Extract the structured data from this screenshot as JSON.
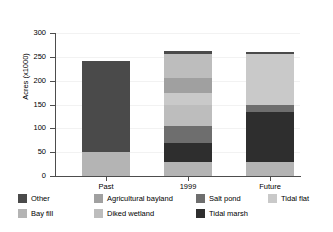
{
  "chart_data": {
    "type": "bar",
    "stacked": true,
    "title": "",
    "xlabel": "",
    "ylabel": "Acres (x1000)",
    "categories": [
      "Past",
      "1999",
      "Future"
    ],
    "ylim": [
      0,
      300
    ],
    "yticks": [
      0,
      50,
      100,
      150,
      200,
      250,
      300
    ],
    "ytick_labels": [
      "0",
      "50",
      "100",
      "150",
      "200",
      "250",
      "300"
    ],
    "grid": true,
    "legend_position": "bottom",
    "series": [
      {
        "name": "Bay fill",
        "color": "#b4b4b4",
        "values": [
          50,
          30,
          29
        ]
      },
      {
        "name": "Tidal marsh",
        "color": "#2e2e2e",
        "values": [
          0,
          39,
          106
        ]
      },
      {
        "name": "Salt pond",
        "color": "#6e6e6e",
        "values": [
          0,
          35,
          13
        ]
      },
      {
        "name": "Diked wetland",
        "color": "#bdbdbd",
        "values": [
          0,
          46,
          0
        ]
      },
      {
        "name": "Tidal flat",
        "color": "#c9c9c9",
        "values": [
          0,
          25,
          108
        ]
      },
      {
        "name": "Agricultural bayland",
        "color": "#a0a0a0",
        "values": [
          0,
          30,
          0
        ]
      },
      {
        "name": "Diked wetland 2",
        "color": "#bdbdbd",
        "values": [
          0,
          50,
          0
        ]
      },
      {
        "name": "Other",
        "color": "#4a4a4a",
        "values": [
          192,
          7,
          5
        ]
      }
    ],
    "totals": [
      242,
      262,
      261
    ],
    "bar_stacks": [
      {
        "category": "Past",
        "segments": [
          {
            "name": "Bay fill",
            "start": 0,
            "end": 50,
            "color": "#b4b4b4"
          },
          {
            "name": "Other",
            "start": 50,
            "end": 242,
            "color": "#4a4a4a"
          }
        ]
      },
      {
        "category": "1999",
        "segments": [
          {
            "name": "Bay fill",
            "start": 0,
            "end": 30,
            "color": "#b4b4b4"
          },
          {
            "name": "Tidal marsh",
            "start": 30,
            "end": 69,
            "color": "#2e2e2e"
          },
          {
            "name": "Salt pond",
            "start": 69,
            "end": 104,
            "color": "#6e6e6e"
          },
          {
            "name": "Diked wetland",
            "start": 104,
            "end": 150,
            "color": "#bdbdbd"
          },
          {
            "name": "Tidal flat",
            "start": 150,
            "end": 175,
            "color": "#c9c9c9"
          },
          {
            "name": "Agricultural bayland",
            "start": 175,
            "end": 205,
            "color": "#a0a0a0"
          },
          {
            "name": "Diked wetland",
            "start": 205,
            "end": 255,
            "color": "#bdbdbd"
          },
          {
            "name": "Other",
            "start": 255,
            "end": 262,
            "color": "#4a4a4a"
          }
        ]
      },
      {
        "category": "Future",
        "segments": [
          {
            "name": "Bay fill",
            "start": 0,
            "end": 29,
            "color": "#b4b4b4"
          },
          {
            "name": "Tidal marsh",
            "start": 29,
            "end": 135,
            "color": "#2e2e2e"
          },
          {
            "name": "Salt pond",
            "start": 135,
            "end": 148,
            "color": "#6e6e6e"
          },
          {
            "name": "Tidal flat",
            "start": 148,
            "end": 256,
            "color": "#c9c9c9"
          },
          {
            "name": "Other",
            "start": 256,
            "end": 261,
            "color": "#4a4a4a"
          }
        ]
      }
    ],
    "legend": [
      {
        "label": "Other",
        "color": "#4a4a4a",
        "row": 0,
        "col": 0
      },
      {
        "label": "Agricultural bayland",
        "color": "#a0a0a0",
        "row": 0,
        "col": 1
      },
      {
        "label": "Salt pond",
        "color": "#6e6e6e",
        "row": 0,
        "col": 2
      },
      {
        "label": "Tidal flat",
        "color": "#c9c9c9",
        "row": 0,
        "col": 3
      },
      {
        "label": "Bay fill",
        "color": "#b4b4b4",
        "row": 1,
        "col": 0
      },
      {
        "label": "Diked wetland",
        "color": "#bdbdbd",
        "row": 1,
        "col": 1
      },
      {
        "label": "Tidal marsh",
        "color": "#2e2e2e",
        "row": 1,
        "col": 2
      }
    ]
  },
  "axis": {
    "y_title": "Acres (x1000)"
  }
}
